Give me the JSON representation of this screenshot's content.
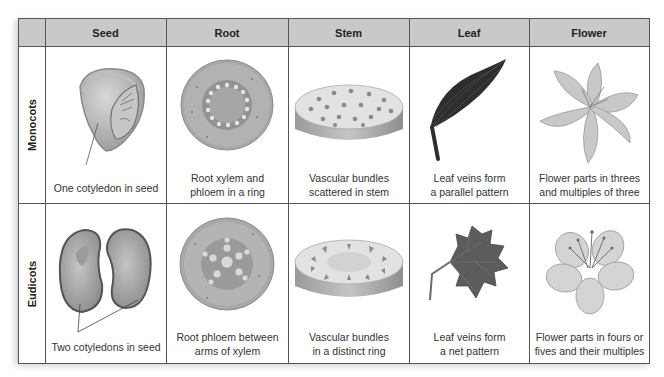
{
  "table": {
    "corner": "",
    "columns": [
      "Seed",
      "Root",
      "Stem",
      "Leaf",
      "Flower"
    ],
    "rows": [
      {
        "label": "Monocots",
        "cells": [
          {
            "caption": "One cotyledon in seed",
            "illustration": "monocot-seed-icon"
          },
          {
            "caption_line1": "Root xylem and",
            "caption_line2": "phloem in a ring",
            "illustration": "monocot-root-cross-section-icon"
          },
          {
            "caption_line1": "Vascular bundles",
            "caption_line2": "scattered in stem",
            "illustration": "monocot-stem-cross-section-icon"
          },
          {
            "caption_line1": "Leaf veins form",
            "caption_line2": "a parallel pattern",
            "illustration": "parallel-vein-leaf-icon"
          },
          {
            "caption_line1": "Flower parts in threes",
            "caption_line2": "and multiples of three",
            "illustration": "lily-flower-icon"
          }
        ]
      },
      {
        "label": "Eudicots",
        "cells": [
          {
            "caption": "Two cotyledons in seed",
            "illustration": "eudicot-bean-seed-icon"
          },
          {
            "caption_line1": "Root phloem between",
            "caption_line2": "arms of xylem",
            "illustration": "eudicot-root-cross-section-icon"
          },
          {
            "caption_line1": "Vascular bundles",
            "caption_line2": "in a distinct ring",
            "illustration": "eudicot-stem-cross-section-icon"
          },
          {
            "caption_line1": "Leaf veins form",
            "caption_line2": "a net pattern",
            "illustration": "net-vein-leaf-icon"
          },
          {
            "caption_line1": "Flower parts in fours or",
            "caption_line2": "fives and their multiples",
            "illustration": "eudicot-flower-icon"
          }
        ]
      }
    ]
  },
  "colors": {
    "header_bg": "#c9c9c9",
    "border": "#555555",
    "text": "#333333"
  }
}
